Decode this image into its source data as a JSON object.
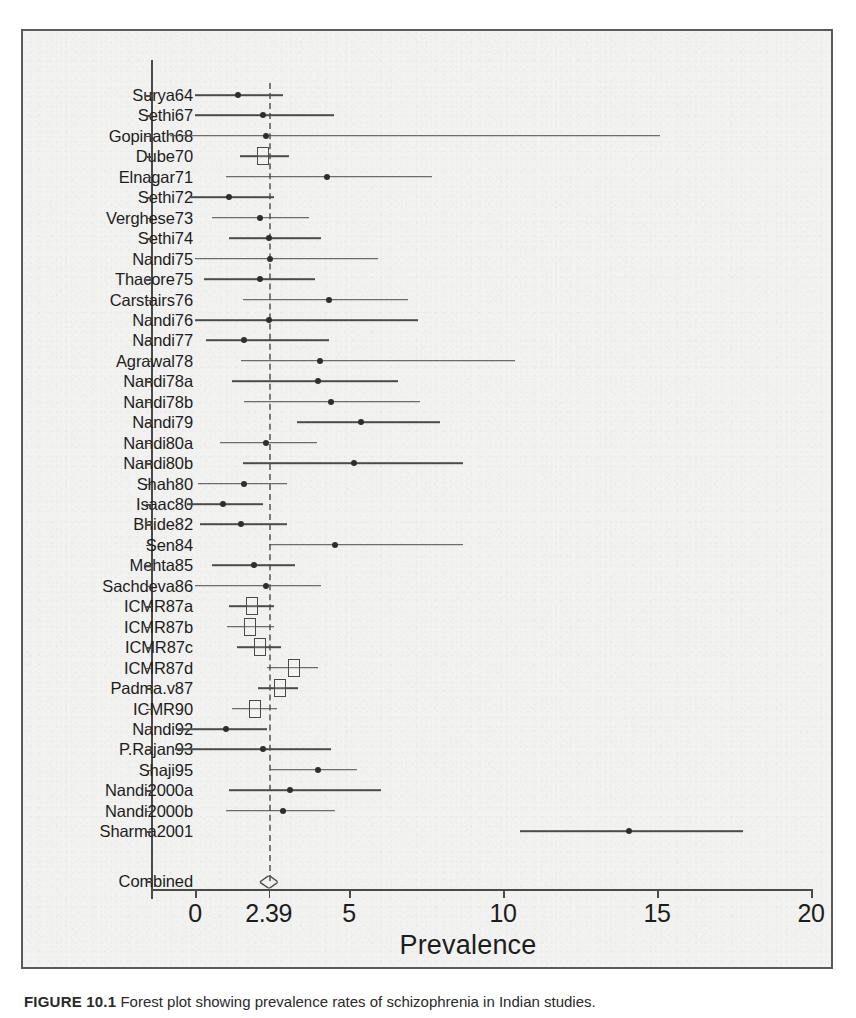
{
  "figure": {
    "caption_label": "FIGURE 10.1",
    "caption_text": "Forest plot showing prevalence rates of schizophrenia in Indian studies."
  },
  "chart_data": {
    "type": "forest",
    "title": "",
    "xlabel": "Prevalence",
    "ylabel": "",
    "xlim": [
      -1.3,
      20.5
    ],
    "xticks": [
      0,
      2.39,
      5,
      10,
      15,
      20
    ],
    "xticklabels": [
      "0",
      "2.39",
      "5",
      "10",
      "15",
      "20"
    ],
    "grid": false,
    "reference_line": 2.39,
    "pooled": {
      "label": "Combined",
      "estimate": 2.39,
      "ci_low": 2.1,
      "ci_high": 2.7,
      "marker": "diamond"
    },
    "studies": [
      {
        "label": "Surya64",
        "estimate": 1.4,
        "ci_low": 0.0,
        "ci_high": 2.85,
        "marker": "dot"
      },
      {
        "label": "Sethi67",
        "estimate": 2.2,
        "ci_low": 0.0,
        "ci_high": 4.5,
        "marker": "dot"
      },
      {
        "label": "Gopinath68",
        "estimate": 2.3,
        "ci_low": -0.8,
        "ci_high": 15.1,
        "marker": "dot"
      },
      {
        "label": "Dube70",
        "estimate": 2.2,
        "ci_low": 1.45,
        "ci_high": 3.05,
        "marker": "box"
      },
      {
        "label": "Elnagar71",
        "estimate": 4.3,
        "ci_low": 1.0,
        "ci_high": 7.7,
        "marker": "dot"
      },
      {
        "label": "Sethi72",
        "estimate": 1.1,
        "ci_low": -0.2,
        "ci_high": 2.55,
        "marker": "dot"
      },
      {
        "label": "Verghese73",
        "estimate": 2.1,
        "ci_low": 0.55,
        "ci_high": 3.7,
        "marker": "dot"
      },
      {
        "label": "Sethi74",
        "estimate": 2.4,
        "ci_low": 1.1,
        "ci_high": 4.1,
        "marker": "dot"
      },
      {
        "label": "Nandi75",
        "estimate": 2.45,
        "ci_low": 0.0,
        "ci_high": 5.95,
        "marker": "dot"
      },
      {
        "label": "Thacore75",
        "estimate": 2.1,
        "ci_low": 0.3,
        "ci_high": 3.9,
        "marker": "dot"
      },
      {
        "label": "Carstairs76",
        "estimate": 4.35,
        "ci_low": 1.55,
        "ci_high": 6.9,
        "marker": "dot"
      },
      {
        "label": "Nandi76",
        "estimate": 2.4,
        "ci_low": 0.0,
        "ci_high": 7.25,
        "marker": "dot"
      },
      {
        "label": "Nandi77",
        "estimate": 1.6,
        "ci_low": 0.35,
        "ci_high": 4.35,
        "marker": "dot"
      },
      {
        "label": "Agrawal78",
        "estimate": 4.05,
        "ci_low": 1.5,
        "ci_high": 10.4,
        "marker": "dot"
      },
      {
        "label": "Nandi78a",
        "estimate": 4.0,
        "ci_low": 1.2,
        "ci_high": 6.6,
        "marker": "dot"
      },
      {
        "label": "Nandi78b",
        "estimate": 4.4,
        "ci_low": 1.6,
        "ci_high": 7.3,
        "marker": "dot"
      },
      {
        "label": "Nandi79",
        "estimate": 5.4,
        "ci_low": 3.3,
        "ci_high": 7.95,
        "marker": "dot"
      },
      {
        "label": "Nandi80a",
        "estimate": 2.3,
        "ci_low": 0.8,
        "ci_high": 3.95,
        "marker": "dot"
      },
      {
        "label": "Nandi80b",
        "estimate": 5.15,
        "ci_low": 1.55,
        "ci_high": 8.7,
        "marker": "dot"
      },
      {
        "label": "Shah80",
        "estimate": 1.6,
        "ci_low": 0.1,
        "ci_high": 3.0,
        "marker": "dot"
      },
      {
        "label": "Isaac80",
        "estimate": 0.9,
        "ci_low": -0.25,
        "ci_high": 2.2,
        "marker": "dot"
      },
      {
        "label": "Bhide82",
        "estimate": 1.5,
        "ci_low": 0.15,
        "ci_high": 3.0,
        "marker": "dot"
      },
      {
        "label": "Sen84",
        "estimate": 4.55,
        "ci_low": 2.4,
        "ci_high": 8.7,
        "marker": "dot"
      },
      {
        "label": "Mehta85",
        "estimate": 1.9,
        "ci_low": 0.55,
        "ci_high": 3.25,
        "marker": "dot"
      },
      {
        "label": "Sachdeva86",
        "estimate": 2.3,
        "ci_low": 0.0,
        "ci_high": 4.1,
        "marker": "dot"
      },
      {
        "label": "ICMR87a",
        "estimate": 1.85,
        "ci_low": 1.1,
        "ci_high": 2.55,
        "marker": "box"
      },
      {
        "label": "ICMR87b",
        "estimate": 1.8,
        "ci_low": 1.05,
        "ci_high": 2.55,
        "marker": "box"
      },
      {
        "label": "ICMR87c",
        "estimate": 2.1,
        "ci_low": 1.35,
        "ci_high": 2.8,
        "marker": "box"
      },
      {
        "label": "ICMR87d",
        "estimate": 3.2,
        "ci_low": 2.35,
        "ci_high": 4.0,
        "marker": "box"
      },
      {
        "label": "Padma.v87",
        "estimate": 2.75,
        "ci_low": 2.05,
        "ci_high": 3.35,
        "marker": "box"
      },
      {
        "label": "ICMR90",
        "estimate": 1.95,
        "ci_low": 1.2,
        "ci_high": 2.65,
        "marker": "box"
      },
      {
        "label": "Nandi92",
        "estimate": 1.0,
        "ci_low": -0.55,
        "ci_high": 2.35,
        "marker": "dot"
      },
      {
        "label": "P.Rajan93",
        "estimate": 2.2,
        "ci_low": -0.65,
        "ci_high": 4.4,
        "marker": "dot"
      },
      {
        "label": "Shaji95",
        "estimate": 4.0,
        "ci_low": 2.45,
        "ci_high": 5.25,
        "marker": "dot"
      },
      {
        "label": "Nandi2000a",
        "estimate": 3.1,
        "ci_low": 1.1,
        "ci_high": 6.05,
        "marker": "dot"
      },
      {
        "label": "Nandi2000b",
        "estimate": 2.85,
        "ci_low": 1.0,
        "ci_high": 4.55,
        "marker": "dot"
      },
      {
        "label": "Sharma2001",
        "estimate": 14.1,
        "ci_low": 10.55,
        "ci_high": 17.8,
        "marker": "dot"
      }
    ]
  }
}
